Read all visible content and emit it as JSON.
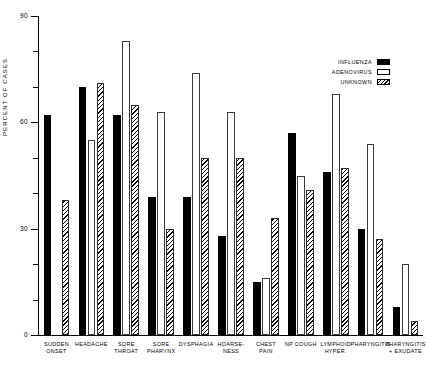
{
  "chart_data": {
    "type": "bar",
    "title": "",
    "xlabel": "",
    "ylabel": "PERCENT OF CASES",
    "ylim": [
      0,
      90
    ],
    "ytick_values": [
      0,
      30,
      60,
      90
    ],
    "ytick_labels": [
      "0",
      "30",
      "60",
      "90"
    ],
    "yminor_values": [
      10,
      20,
      40,
      50,
      70,
      80
    ],
    "grid": false,
    "legend_position": "top-right",
    "categories": [
      "SUDDEN\nONSET",
      "HEADACHE",
      "SORE\nTHROAT",
      "SORE\nPHARYNX",
      "DYSPHAGIA",
      "HOARSE-\nNESS",
      "CHEST\nPAIN",
      "NP COUGH",
      "LYMPHOID\nHYPER.",
      "PHARYNGITIS",
      "PHARYNGITIS\n+ EXUDATE"
    ],
    "series": [
      {
        "name": "INFLUENZA",
        "style": "solid-black",
        "color": "#000000",
        "values": [
          62,
          70,
          62,
          39,
          39,
          28,
          15,
          57,
          46,
          30,
          8
        ]
      },
      {
        "name": "ADENOVIRUS",
        "style": "open-white",
        "color": "#ffffff",
        "values": [
          0,
          55,
          83,
          63,
          74,
          63,
          16,
          45,
          68,
          54,
          20
        ]
      },
      {
        "name": "UNKNOWN",
        "style": "hatched",
        "color": "#ffffff",
        "values": [
          38,
          71,
          65,
          30,
          50,
          50,
          33,
          41,
          47,
          27,
          4
        ]
      }
    ]
  },
  "legend": {
    "entries": [
      {
        "label": "INFLUENZA",
        "swatch": "solid-black"
      },
      {
        "label": "ADENOVIRUS",
        "swatch": "open-white"
      },
      {
        "label": "UNKNOWN",
        "swatch": "hatched"
      }
    ]
  }
}
